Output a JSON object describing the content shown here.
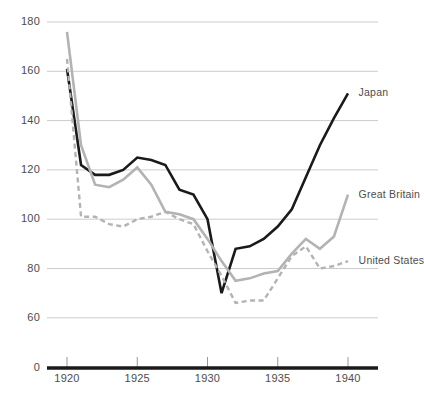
{
  "chart_data": {
    "type": "line",
    "title": "",
    "subtitle": "",
    "xlabel": "",
    "ylabel": "",
    "xlim": [
      1919,
      1941
    ],
    "ylim": [
      55,
      185
    ],
    "y_axis_broken_to_zero": true,
    "grid": true,
    "grid_axis": "y",
    "legend_position": "right-inline-labels",
    "yticks": [
      180,
      160,
      140,
      120,
      100,
      80,
      60,
      0
    ],
    "ytick_labels": [
      "180",
      "160",
      "140",
      "120",
      "100",
      "80",
      "60",
      "0"
    ],
    "xticks": [
      1920,
      1925,
      1930,
      1935,
      1940
    ],
    "xtick_labels": [
      "1920",
      "1925",
      "1930",
      "1935",
      "1940"
    ],
    "x": [
      1920,
      1921,
      1922,
      1923,
      1924,
      1925,
      1926,
      1927,
      1928,
      1929,
      1930,
      1931,
      1932,
      1933,
      1934,
      1935,
      1936,
      1937,
      1938,
      1939,
      1940
    ],
    "series": [
      {
        "name": "Japan",
        "color": "#1a1a1a",
        "style": "solid",
        "width": 2.6,
        "label": "Japan",
        "values": [
          161,
          122,
          118,
          118,
          120,
          125,
          124,
          122,
          112,
          110,
          100,
          70,
          88,
          89,
          92,
          97,
          104,
          117,
          130,
          141,
          151
        ]
      },
      {
        "name": "Great Britain",
        "color": "#b3b3b3",
        "style": "solid",
        "width": 2.6,
        "label": "Great Britain",
        "values": [
          176,
          130,
          114,
          113,
          116,
          121,
          114,
          103,
          102,
          100,
          92,
          83,
          75,
          76,
          78,
          79,
          86,
          92,
          88,
          93,
          110
        ]
      },
      {
        "name": "United States",
        "color": "#b3b3b3",
        "style": "dashed",
        "width": 2.4,
        "label": "United States",
        "values": [
          165,
          101,
          101,
          98,
          97,
          100,
          101,
          103,
          100,
          98,
          87,
          77,
          66,
          67,
          67,
          76,
          85,
          89,
          80,
          81,
          83
        ]
      }
    ],
    "annotations": [
      {
        "text": "Japan",
        "x": 1940.4,
        "y": 151
      },
      {
        "text": "Great Britain",
        "x": 1940.4,
        "y": 110
      },
      {
        "text": "United States",
        "x": 1940.4,
        "y": 83
      }
    ]
  },
  "axis": {
    "baseline_color": "#1a1a1a",
    "grid_color": "#cccccc",
    "tick_color": "#999999",
    "label_color": "#4d4d4d"
  }
}
